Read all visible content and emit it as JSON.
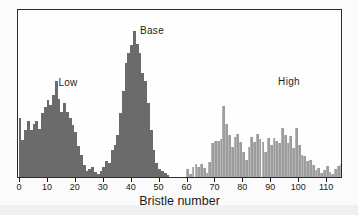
{
  "figure": {
    "xlabel": "Bristle number",
    "annotations": [
      {
        "id": "low",
        "text": "Low",
        "cx": 50,
        "top": 67
      },
      {
        "id": "base",
        "text": "Base",
        "cx": 134,
        "top": 15
      },
      {
        "id": "high",
        "text": "High",
        "cx": 271,
        "top": 66
      }
    ]
  },
  "chart_data": {
    "type": "bar",
    "subtype": "histogram",
    "title": "",
    "xlabel": "Bristle number",
    "ylabel": "",
    "y_axis_shown": false,
    "values_unit": "relative frequency (heights in plot pixels, no y-axis in original)",
    "x_ticks": [
      0,
      10,
      20,
      30,
      40,
      50,
      60,
      70,
      80,
      90,
      100,
      110
    ],
    "xlim": [
      -1,
      116
    ],
    "ylim_px": [
      0,
      167
    ],
    "bin_width": 1,
    "legend_position": "none",
    "grid": false,
    "series": [
      {
        "name": "Low selection line",
        "annotation": "Low",
        "color": "#6b6b6b",
        "start_x": 0,
        "values": [
          59,
          37,
          47,
          56,
          47,
          53,
          56,
          48,
          64,
          70,
          77,
          72,
          82,
          96,
          78,
          65,
          74,
          65,
          59,
          52,
          45,
          31,
          22,
          12,
          6,
          8,
          10,
          5,
          3,
          6
        ]
      },
      {
        "name": "Base population",
        "annotation": "Base",
        "color": "#6b6b6b",
        "start_x": 30,
        "values": [
          10,
          16,
          14,
          27,
          32,
          42,
          64,
          86,
          114,
          124,
          132,
          146,
          133,
          124,
          104,
          96,
          74,
          47,
          27,
          14,
          8,
          6,
          4,
          2
        ]
      },
      {
        "name": "High selection line",
        "annotation": "High",
        "color": "#9c9c9c",
        "start_x": 60,
        "values": [
          8,
          3,
          10,
          13,
          10,
          13,
          9,
          4,
          15,
          34,
          36,
          36,
          38,
          71,
          53,
          42,
          30,
          40,
          43,
          35,
          25,
          17,
          30,
          40,
          35,
          43,
          38,
          35,
          25,
          39,
          32,
          39,
          36,
          34,
          49,
          42,
          34,
          41,
          29,
          49,
          32,
          22,
          21,
          16,
          17,
          12,
          7,
          9,
          4,
          7,
          11,
          5,
          3,
          8,
          11,
          13
        ]
      }
    ]
  },
  "colors": {
    "dark_bar": "#6b6b6b",
    "light_bar": "#9c9c9c",
    "frame": "#2a2a2a",
    "background": "#fbfbfb",
    "text": "#1a1a1a"
  }
}
